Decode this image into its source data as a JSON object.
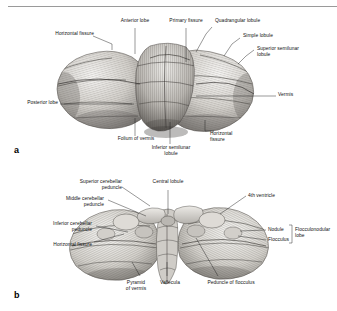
{
  "figure": {
    "title_divider": "top-rule",
    "panels": [
      {
        "letter": "a",
        "view": "superior view of the cerebellum",
        "labels": [
          {
            "id": "horizontal-fissure-a",
            "text": "Horizontal fissure",
            "align": "right"
          },
          {
            "id": "anterior-lobe",
            "text": "Anterior lobe",
            "align": "center"
          },
          {
            "id": "primary-fissure",
            "text": "Primary fissure",
            "align": "center"
          },
          {
            "id": "quadrangular-lobule",
            "text": "Quadrangular lobule",
            "align": "left"
          },
          {
            "id": "simple-lobule",
            "text": "Simple lobule",
            "align": "left"
          },
          {
            "id": "superior-semilunar-lobule",
            "text": "Superior semilunar\nlobule",
            "align": "left"
          },
          {
            "id": "vermis-a",
            "text": "Vermis",
            "align": "left"
          },
          {
            "id": "posterior-lobe",
            "text": "Posterior lobe",
            "align": "right"
          },
          {
            "id": "folium-of-vermis",
            "text": "Folium of vermis",
            "align": "center"
          },
          {
            "id": "inferior-semilunar-lobule",
            "text": "Inferior semilunar\nlobule",
            "align": "center"
          },
          {
            "id": "horizontal-fissure-a2",
            "text": "Horizontal\nfissure",
            "align": "left"
          }
        ]
      },
      {
        "letter": "b",
        "view": "anterior-inferior view of the cerebellum",
        "labels": [
          {
            "id": "superior-cerebellar-peduncle",
            "text": "Superior cerebellar\npeduncle",
            "align": "right"
          },
          {
            "id": "middle-cerebellar-peduncle",
            "text": "Middle cerebellar\npeduncle",
            "align": "right"
          },
          {
            "id": "inferior-cerebellar-peduncle",
            "text": "Inferior cerebellar\npeduncle",
            "align": "right"
          },
          {
            "id": "horizontal-fissure-b",
            "text": "Horizontal fissure",
            "align": "right"
          },
          {
            "id": "central-lobule",
            "text": "Central lobule",
            "align": "center"
          },
          {
            "id": "fourth-ventricle",
            "text": "4th ventricle",
            "align": "left"
          },
          {
            "id": "nodule",
            "text": "Nodule",
            "align": "left"
          },
          {
            "id": "flocculus",
            "text": "Flocculus",
            "align": "left"
          },
          {
            "id": "flocculonodular-lobe",
            "text": "Flocculonodular\nlobe",
            "align": "left"
          },
          {
            "id": "pyramid-of-vermis",
            "text": "Pyramid\nof vermis",
            "align": "center"
          },
          {
            "id": "vallecula",
            "text": "Vallecula",
            "align": "center"
          },
          {
            "id": "peduncle-of-flocculus",
            "text": "Peduncle of flocculus",
            "align": "center"
          }
        ]
      }
    ],
    "colors": {
      "ink": "#1a1a1a",
      "rule": "#9a9a9a",
      "page": "#ffffff",
      "tissue_light": "#efedea",
      "tissue_mid": "#c9c6c1",
      "tissue_dark": "#8d8a86",
      "tissue_shadow": "#5d5a57"
    }
  }
}
